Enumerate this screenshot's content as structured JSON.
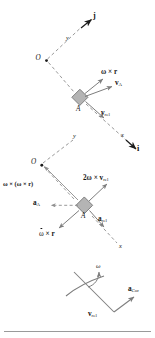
{
  "figure": {
    "type": "vector-diagram",
    "panels": [
      {
        "name": "velocity-panel",
        "origin_label": "O",
        "point_label": "A",
        "axis_x_label": "x",
        "axis_y_label": "y",
        "unit_vector_i": "i",
        "unit_vector_j": "j",
        "vectors": [
          {
            "name": "omega-cross-r",
            "label": "ω × r"
          },
          {
            "name": "v-A",
            "label": "v",
            "sub": "A"
          },
          {
            "name": "v-rel",
            "label": "v",
            "sub": "rel"
          }
        ]
      },
      {
        "name": "acceleration-panel",
        "origin_label": "O",
        "point_label": "A",
        "axis_x_label": "x",
        "axis_y_label": "y",
        "vectors": [
          {
            "name": "omega-cross-omega-cross-r",
            "label": "ω × (ω × r)"
          },
          {
            "name": "two-omega-cross-v-rel",
            "label": "2ω × v",
            "sub": "rel"
          },
          {
            "name": "a-A",
            "label": "a",
            "sub": "A"
          },
          {
            "name": "a-rel",
            "label": "a",
            "sub": "rel"
          },
          {
            "name": "omega-dot-cross-r",
            "label": "ω × r"
          }
        ]
      },
      {
        "name": "coriolis-panel",
        "vectors": [
          {
            "name": "omega-curved",
            "label": "ω"
          },
          {
            "name": "v-rel",
            "label": "v",
            "sub": "rel"
          },
          {
            "name": "a-Cor",
            "label": "a",
            "sub": "Cor"
          }
        ]
      }
    ],
    "labels": {
      "origin_upper": "O",
      "origin_lower": "O",
      "point_upper": "A",
      "point_lower": "A",
      "axis_y_upper": "y",
      "axis_x_upper": "x",
      "axis_y_lower": "y",
      "axis_x_lower": "x",
      "unit_i": "i",
      "unit_j": "j",
      "omega_cross_r": "ω × r",
      "v_A_base": "v",
      "v_A_sub": "A",
      "v_rel_base": "v",
      "v_rel_sub": "rel",
      "omega_cross_omega_cross_r": "ω × (ω × r)",
      "two_omega_prefix": "2ω × ",
      "a_A_base": "a",
      "a_A_sub": "A",
      "a_rel_base": "a",
      "a_rel_sub": "rel",
      "omega_dot_base": "ω",
      "omega_dot_rest": " × r",
      "omega_bottom": "ω",
      "a_Cor_base": "a",
      "a_Cor_sub": "Cor",
      "v_rel_bottom_base": "v",
      "v_rel_bottom_sub": "rel"
    },
    "colors": {
      "line": "#8d8d8d",
      "arrow": "#7d7d7d",
      "text": "#141414",
      "block_fill": "#b4b4b4",
      "block_stroke": "#6f6f6f",
      "rule": "#9a9a9a",
      "background": "#ffffff"
    }
  }
}
